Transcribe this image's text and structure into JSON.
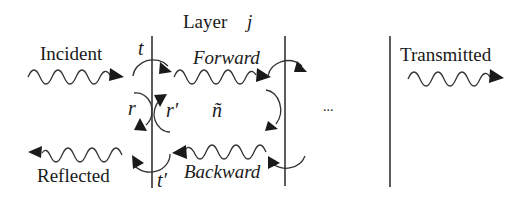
{
  "diagram": {
    "title": {
      "word": "Layer",
      "index": "j"
    },
    "waves": {
      "incident": "Incident",
      "reflected": "Reflected",
      "transmitted": "Transmitted",
      "forward": "Forward",
      "backward": "Backward"
    },
    "coefficients": {
      "t": "t",
      "t_prime": "t′",
      "r": "r",
      "r_prime": "r′"
    },
    "layer_index": "ñ",
    "ellipsis": "...",
    "colors": {
      "ink": "#1a1a1a",
      "background": "#ffffff"
    }
  }
}
